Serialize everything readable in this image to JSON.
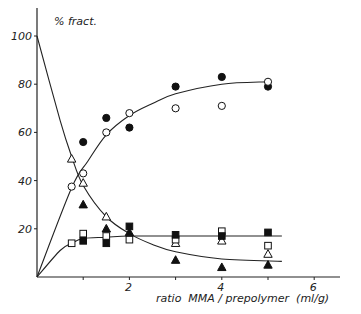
{
  "chart_data": {
    "type": "scatter",
    "title": "",
    "ylabel": "% fract.",
    "xlabel": "ratio  MMA / prepolymer  (ml/g)",
    "xlim": [
      0,
      6.5
    ],
    "ylim": [
      0,
      110
    ],
    "x_ticks": [
      1,
      2,
      3,
      4,
      5,
      6
    ],
    "x_tick_labels": [
      "",
      "2",
      "",
      "4",
      "",
      "6"
    ],
    "y_ticks": [
      20,
      40,
      60,
      80,
      100
    ],
    "y_tick_labels": [
      "20",
      "40",
      "60",
      "80",
      "100"
    ],
    "grid": false,
    "legend": null,
    "series": [
      {
        "name": "filled-circle",
        "marker": "circle",
        "filled": true,
        "x": [
          1,
          1.5,
          2,
          3,
          4,
          5
        ],
        "y": [
          56,
          66,
          62,
          79,
          83,
          79
        ]
      },
      {
        "name": "open-circle",
        "marker": "circle",
        "filled": false,
        "x": [
          0.75,
          1,
          1.5,
          2,
          3,
          4,
          5
        ],
        "y": [
          37.5,
          43,
          60,
          68,
          70,
          71,
          81
        ]
      },
      {
        "name": "open-triangle",
        "marker": "triangle",
        "filled": false,
        "x": [
          0.75,
          1,
          1.5,
          3,
          4,
          5
        ],
        "y": [
          49,
          39,
          25,
          14,
          15,
          9.5
        ]
      },
      {
        "name": "filled-triangle",
        "marker": "triangle",
        "filled": true,
        "x": [
          1,
          1.5,
          2,
          3,
          4,
          5
        ],
        "y": [
          30,
          20,
          18.5,
          7,
          4,
          5
        ]
      },
      {
        "name": "open-square",
        "marker": "square",
        "filled": false,
        "x": [
          0.75,
          1,
          1.5,
          2,
          3,
          4,
          5
        ],
        "y": [
          14,
          18,
          17,
          15.5,
          15.5,
          19,
          13
        ]
      },
      {
        "name": "filled-square",
        "marker": "square",
        "filled": true,
        "x": [
          1,
          1.5,
          2,
          3,
          4,
          5
        ],
        "y": [
          15,
          14,
          21,
          17.5,
          17,
          18.5
        ]
      }
    ],
    "fit_curves": [
      {
        "name": "circle-rise",
        "points": [
          [
            0,
            0
          ],
          [
            0.75,
            37
          ],
          [
            1.1,
            48
          ],
          [
            1.5,
            59
          ],
          [
            2,
            67
          ],
          [
            2.5,
            72
          ],
          [
            3,
            76
          ],
          [
            4,
            80
          ],
          [
            5,
            81
          ]
        ]
      },
      {
        "name": "triangle-decay",
        "points": [
          [
            0,
            100
          ],
          [
            0.5,
            65
          ],
          [
            0.75,
            50
          ],
          [
            1,
            38
          ],
          [
            1.5,
            25
          ],
          [
            2,
            18
          ],
          [
            2.5,
            13.5
          ],
          [
            3,
            10.5
          ],
          [
            4,
            7.5
          ],
          [
            5.3,
            6.5
          ]
        ]
      },
      {
        "name": "square-plateau",
        "points": [
          [
            0,
            0
          ],
          [
            0.5,
            11
          ],
          [
            0.75,
            14
          ],
          [
            1,
            16
          ],
          [
            1.5,
            16.5
          ],
          [
            2,
            17
          ],
          [
            3,
            17
          ],
          [
            4,
            17
          ],
          [
            5,
            17
          ],
          [
            5.3,
            17
          ]
        ]
      }
    ]
  }
}
